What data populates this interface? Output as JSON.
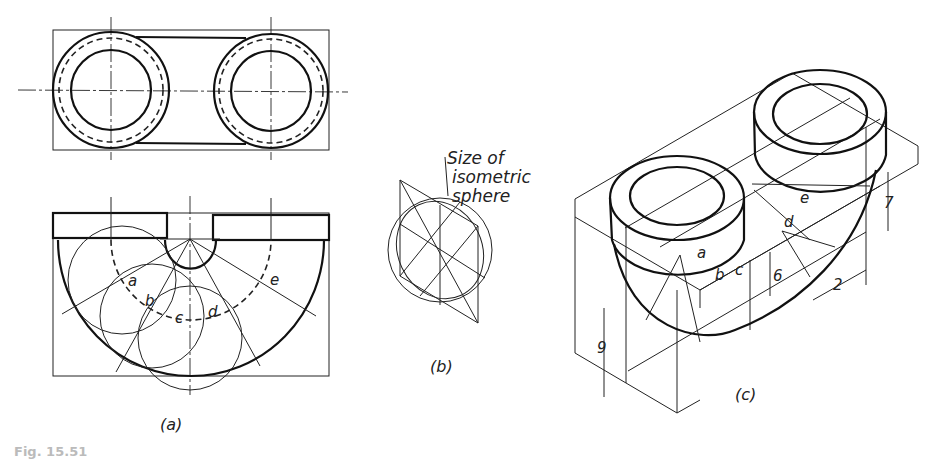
{
  "figure": {
    "panels": [
      {
        "id": "a",
        "label": "(a)",
        "description": "Top and front orthographic views of U-bend pipe with construction circles",
        "arc_labels": [
          "a",
          "b",
          "c",
          "d",
          "e"
        ]
      },
      {
        "id": "b",
        "label": "(b)",
        "description": "Isometric sphere construction",
        "note": [
          "Size of",
          "isometric",
          "sphere"
        ]
      },
      {
        "id": "c",
        "label": "(c)",
        "description": "Isometric drawing of U-bend with dimensions",
        "point_labels": [
          "a",
          "b",
          "c",
          "d",
          "e"
        ],
        "dimensions": [
          "9",
          "6",
          "7",
          "2"
        ]
      }
    ],
    "caption": "Fig. 15.51"
  }
}
